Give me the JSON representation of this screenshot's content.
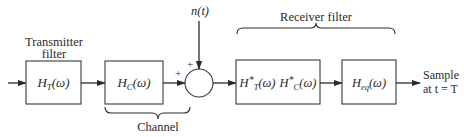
{
  "diagram": {
    "type": "block-diagram",
    "labels": {
      "transmitter_filter_line1": "Transmitter",
      "transmitter_filter_line2": "filter",
      "channel": "Channel",
      "receiver_filter": "Receiver filter",
      "noise": "n(t)",
      "sample_line1": "Sample",
      "sample_line2": "at t = T",
      "plus_left": "+",
      "plus_top": "+"
    },
    "blocks": [
      {
        "id": "transmitter",
        "symbol": "H",
        "subscript": "T",
        "arg": "(ω)",
        "star": ""
      },
      {
        "id": "channel",
        "symbol": "H",
        "subscript": "C",
        "arg": "(ω)",
        "star": ""
      },
      {
        "id": "matched",
        "part1_symbol": "H",
        "part1_star": "*",
        "part1_subscript": "T",
        "part1_arg": "(ω)",
        "part2_symbol": "H",
        "part2_star": "*",
        "part2_subscript": "C",
        "part2_arg": "(ω)"
      },
      {
        "id": "equalizer",
        "symbol": "H",
        "subscript": "eq",
        "arg": "(ω)",
        "star": ""
      }
    ],
    "connections": [
      "input → H_T(ω)",
      "H_T(ω) → H_C(ω)",
      "H_C(ω) → summer (+)",
      "n(t) → summer (+)",
      "summer → H*_T(ω) H*_C(ω)",
      "H*_T(ω) H*_C(ω) → H_eq(ω)",
      "H_eq(ω) → Sample at t = T"
    ],
    "groups": [
      {
        "name": "Channel",
        "spans": [
          "H_C(ω)",
          "summer"
        ]
      },
      {
        "name": "Receiver filter",
        "spans": [
          "H*_T(ω) H*_C(ω)",
          "H_eq(ω)"
        ]
      }
    ]
  }
}
